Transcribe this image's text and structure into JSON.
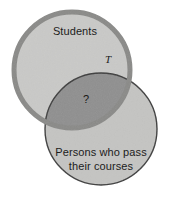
{
  "diagram": {
    "type": "venn",
    "title": "",
    "canvas": {
      "width": 173,
      "height": 201,
      "background": "#ffffff"
    },
    "colors": {
      "set_a_fill": "#c9c9c7",
      "set_a_stroke": "#8a8a88",
      "set_b_fill": "#c4c4c2",
      "set_b_stroke": "#3a3a3a",
      "intersection_fill": "#8f8f8f",
      "text": "#1c1c1c"
    },
    "sets": [
      {
        "id": "students",
        "label": "Students",
        "label_lines": [
          "Students"
        ],
        "fill": "#c9c9c7",
        "stroke": "#8a8a88",
        "stroke_width": 5,
        "cx": 72,
        "cy": 70,
        "r": 58
      },
      {
        "id": "passers",
        "label": "Persons who pass their courses",
        "label_lines": [
          "Persons who pass",
          "their courses"
        ],
        "fill": "#c4c4c2",
        "stroke": "#3a3a3a",
        "stroke_width": 1.4,
        "cx": 101,
        "cy": 129,
        "r": 56
      }
    ],
    "regions": [
      {
        "id": "intersection",
        "marker": "?",
        "fill": "#8f8f8f",
        "x": 86,
        "y": 100
      }
    ],
    "markers": [
      {
        "id": "universe",
        "label": "T",
        "x": 108,
        "y": 60
      }
    ]
  }
}
